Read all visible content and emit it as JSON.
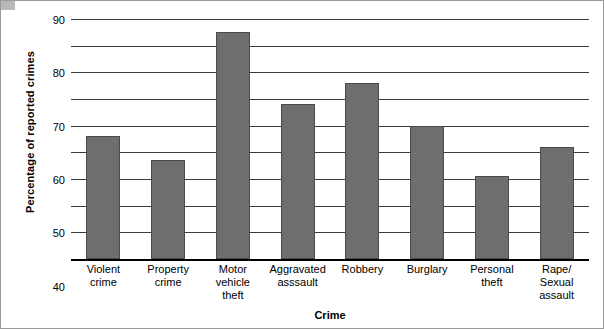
{
  "chart_data": {
    "type": "bar",
    "title": "",
    "xlabel": "Crime",
    "ylabel": "Percentage of reported crimes",
    "categories": [
      "Violent\ncrime",
      "Property\ncrime",
      "Motor\nvehicle\ntheft",
      "Aggravated\nasssault",
      "Robbery",
      "Burglary",
      "Personal\ntheft",
      "Rape/\nSexual\nassault"
    ],
    "category_lines": [
      [
        "Violent",
        "crime"
      ],
      [
        "Property",
        "crime"
      ],
      [
        "Motor",
        "vehicle",
        "theft"
      ],
      [
        "Aggravated",
        "asssault"
      ],
      [
        "Robbery"
      ],
      [
        "Burglary"
      ],
      [
        "Personal",
        "theft"
      ],
      [
        "Rape/",
        "Sexual",
        "assault"
      ]
    ],
    "values": [
      46,
      37,
      85,
      58,
      66,
      50,
      31,
      42
    ],
    "ylim": [
      0,
      90
    ],
    "yticks": [
      0,
      10,
      20,
      30,
      40,
      50,
      60,
      70,
      80,
      90
    ],
    "grid": true,
    "legend": "none",
    "bar_color": "#6e6e6e"
  }
}
